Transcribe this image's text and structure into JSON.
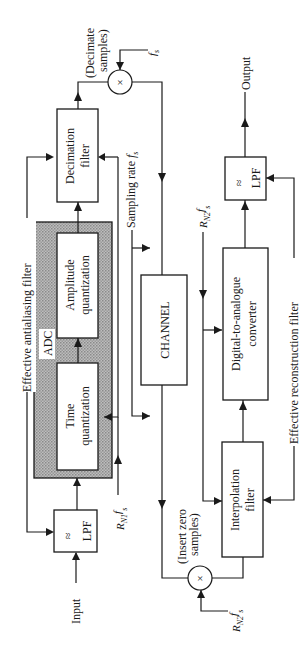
{
  "diagram": {
    "orientation": "rotated-90-ccw",
    "blocks": {
      "input_lpf": {
        "symbol": "≈",
        "label": "LPF"
      },
      "adc": {
        "label": "ADC"
      },
      "time_quantization": {
        "line1": "Time",
        "line2": "quantization"
      },
      "amplitude_quantization": {
        "line1": "Amplitude",
        "line2": "quantization"
      },
      "decimation_filter": {
        "line1": "Decimation",
        "line2": "filter"
      },
      "channel": {
        "label": "CHANNEL"
      },
      "interpolation_filter": {
        "line1": "Interpolation",
        "line2": "filter"
      },
      "dac": {
        "line1": "Digital-to-analogue",
        "line2": "converter"
      },
      "output_lpf": {
        "symbol": "≈",
        "label": "LPF"
      }
    },
    "labels": {
      "input": "Input",
      "output": "Output",
      "effective_antialiasing_filter": "Effective antialiasing filter",
      "effective_reconstruction_filter": "Effective reconstruction filter",
      "sampling_rate": "Sampling rate fs",
      "decimate_line1": "(Decimate",
      "decimate_line2": "samples)",
      "insert_zero_line1": "(Insert zero",
      "insert_zero_line2": "samples)",
      "fs": "fs",
      "rn1_fs": "RN1fs",
      "rn2_fs_dac": "RN2fs",
      "rn2_fs_mult": "RN2fs",
      "multiply_symbol": "×"
    }
  }
}
